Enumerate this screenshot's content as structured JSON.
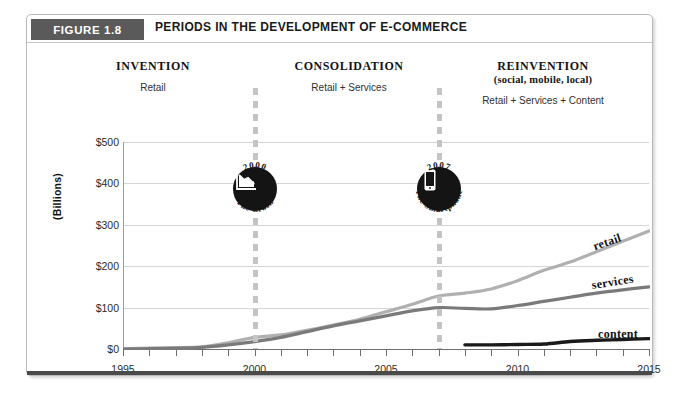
{
  "figure": {
    "badge_label": "FIGURE 1.8",
    "title": "PERIODS IN THE DEVELOPMENT OF E-COMMERCE"
  },
  "periods": [
    {
      "title": "INVENTION",
      "subtitle": "",
      "description": "Retail"
    },
    {
      "title": "CONSOLIDATION",
      "subtitle": "",
      "description": "Retail + Services"
    },
    {
      "title": "REINVENTION",
      "subtitle": "(social, mobile, local)",
      "description": "Retail + Services + Content"
    }
  ],
  "milestones": [
    {
      "year": "2000",
      "caption": "The Crash",
      "icon": "declining-chart-icon",
      "x_year": 2000
    },
    {
      "year": "2007",
      "caption": "The Smartphone",
      "icon": "smartphone-icon",
      "x_year": 2007
    }
  ],
  "colors": {
    "retail": "#b0b0b0",
    "services": "#7a7a7a",
    "content": "#1a1a1a",
    "badge": "#5a5a5a",
    "grid": "#d5d5d5",
    "divider": "#c4c4c4"
  },
  "chart_data": {
    "type": "line",
    "title": "PERIODS IN THE DEVELOPMENT OF E-COMMERCE",
    "xlabel": "",
    "ylabel": "(Billions)",
    "xlim": [
      1995,
      2015
    ],
    "ylim": [
      0,
      500
    ],
    "ytick_labels": [
      "$500",
      "$400",
      "$300",
      "$200",
      "$100",
      "$0"
    ],
    "ytick_values": [
      500,
      400,
      300,
      200,
      100,
      0
    ],
    "xtick_labels": [
      "1995",
      "2000",
      "2005",
      "2010",
      "2015"
    ],
    "xtick_values": [
      1995,
      2000,
      2005,
      2010,
      2015
    ],
    "grid": true,
    "legend": "inline-end-of-line",
    "x": [
      1995,
      1996,
      1997,
      1998,
      1999,
      2000,
      2001,
      2002,
      2003,
      2004,
      2005,
      2006,
      2007,
      2008,
      2009,
      2010,
      2011,
      2012,
      2013,
      2014,
      2015
    ],
    "series": [
      {
        "name": "retail",
        "values": [
          1,
          2,
          3,
          5,
          15,
          28,
          34,
          45,
          58,
          72,
          90,
          108,
          128,
          135,
          145,
          165,
          190,
          210,
          235,
          260,
          285
        ]
      },
      {
        "name": "services",
        "values": [
          0,
          1,
          2,
          4,
          10,
          18,
          28,
          42,
          56,
          68,
          80,
          92,
          100,
          98,
          97,
          105,
          115,
          125,
          135,
          143,
          150
        ]
      },
      {
        "name": "content",
        "values": [
          null,
          null,
          null,
          null,
          null,
          null,
          null,
          null,
          null,
          null,
          null,
          null,
          null,
          10,
          10,
          11,
          12,
          18,
          21,
          23,
          25
        ]
      }
    ]
  }
}
